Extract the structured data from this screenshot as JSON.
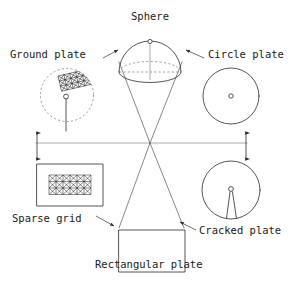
{
  "diagram": {
    "type": "radial-shape-diagram",
    "canvas": {
      "width": 298,
      "height": 285
    },
    "background_color": "#ffffff",
    "line_color": "#2b2b2b",
    "text_color": "#1a1a1a",
    "hub": {
      "x": 150,
      "y": 143,
      "spokes": 6
    },
    "labels": {
      "sphere": "Sphere",
      "ground_plate": "Ground plate",
      "circle_plate": "Circle plate",
      "sparse_grid": "Sparse grid",
      "rectangular_plate": "Rectangular plate",
      "cracked_plate": "Cracked plate"
    },
    "nodes": [
      {
        "id": "sphere",
        "label": "Sphere",
        "shape": "hemisphere",
        "label_x": 150,
        "label_y": 18,
        "center_x": 150,
        "center_y": 56,
        "radius": 31,
        "features": [
          "dome-outline",
          "dashed-base-ellipse",
          "apex-node",
          "vertical-axis"
        ]
      },
      {
        "id": "ground-plate",
        "label": "Ground plate",
        "shape": "circle",
        "label_x": 10,
        "label_y": 58,
        "center_x": 67,
        "center_y": 95,
        "radius": 27,
        "features": [
          "dashed-circle-outline",
          "triangulated-patch",
          "antenna-line",
          "feed-node"
        ]
      },
      {
        "id": "circle-plate",
        "label": "Circle plate",
        "shape": "circle",
        "label_x": 210,
        "label_y": 58,
        "center_x": 231,
        "center_y": 96,
        "radius": 28,
        "features": [
          "circle-outline",
          "center-node"
        ]
      },
      {
        "id": "sparse-grid",
        "label": "Sparse grid",
        "shape": "rectangle",
        "label_x": 12,
        "label_y": 220,
        "rect_x": 37,
        "rect_y": 164,
        "rect_w": 66,
        "rect_h": 42,
        "features": [
          "rectangle-outline",
          "triangulated-mesh"
        ]
      },
      {
        "id": "rectangular-plate",
        "label": "Rectangular plate",
        "shape": "rectangle",
        "label_x": 97,
        "label_y": 265,
        "rect_x": 119,
        "rect_y": 230,
        "rect_w": 66,
        "rect_h": 42,
        "features": [
          "rectangle-outline"
        ]
      },
      {
        "id": "cracked-plate",
        "label": "Cracked plate",
        "shape": "circle",
        "label_x": 200,
        "label_y": 232,
        "center_x": 231,
        "center_y": 190,
        "radius": 29,
        "features": [
          "circle-outline",
          "center-node",
          "crack-wedge"
        ]
      }
    ],
    "connectors": [
      {
        "id": "spoke-upper-left",
        "from": "hub",
        "to": "sphere-left",
        "kind": "line"
      },
      {
        "id": "spoke-upper-right",
        "from": "hub",
        "to": "sphere-right",
        "kind": "line"
      },
      {
        "id": "spoke-left",
        "from": "hub",
        "to": "left-margin",
        "kind": "line"
      },
      {
        "id": "spoke-right",
        "from": "hub",
        "to": "right-margin",
        "kind": "line"
      },
      {
        "id": "spoke-lower-left",
        "from": "hub",
        "to": "lower-left",
        "kind": "line"
      },
      {
        "id": "spoke-lower-right",
        "from": "hub",
        "to": "lower-right",
        "kind": "line"
      },
      {
        "id": "arrow-left-vertical",
        "kind": "double-arrow",
        "orientation": "vertical",
        "x": 37,
        "y1": 131,
        "y2": 160
      },
      {
        "id": "arrow-right-vertical",
        "kind": "double-arrow",
        "orientation": "vertical",
        "x": 246,
        "y1": 131,
        "y2": 160
      }
    ],
    "leaders": [
      {
        "id": "leader-ground-plate",
        "target": "ground-plate"
      },
      {
        "id": "leader-circle-plate",
        "target": "circle-plate"
      },
      {
        "id": "leader-sparse-grid",
        "target": "sparse-grid"
      },
      {
        "id": "leader-rectangular-plate",
        "target": "rectangular-plate"
      },
      {
        "id": "leader-cracked-plate",
        "target": "cracked-plate"
      }
    ]
  }
}
